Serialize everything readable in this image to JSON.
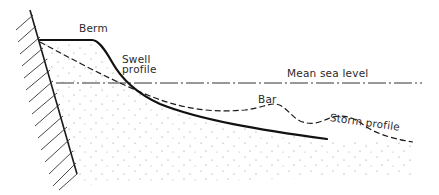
{
  "diagram": {
    "type": "beach-profile-cross-section",
    "labels": {
      "berm": "Berm",
      "swell_profile_line1": "Swell",
      "swell_profile_line2": "profile",
      "mean_sea_level": "Mean sea level",
      "bar": "Bar",
      "storm_profile": "Storm profile"
    },
    "elements": [
      {
        "name": "seawall",
        "style": "hatched"
      },
      {
        "name": "swell-profile",
        "style": "solid"
      },
      {
        "name": "storm-profile",
        "style": "dashed"
      },
      {
        "name": "mean-sea-level",
        "style": "dash-dot"
      },
      {
        "name": "sand",
        "style": "stippled"
      }
    ],
    "colors": {
      "line": "#1a1a1a",
      "stipple": "#8a8a8a",
      "background": "#ffffff"
    }
  }
}
